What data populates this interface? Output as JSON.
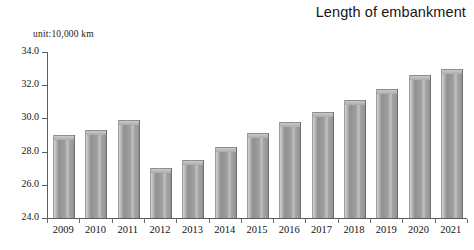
{
  "chart_data": {
    "type": "bar",
    "title": "Length of embankment",
    "unit_label": "unit:10,000 km",
    "xlabel": "",
    "ylabel": "",
    "ylim": [
      24.0,
      34.0
    ],
    "ytick_step": 2.0,
    "ytick_labels": [
      "34.0",
      "32.0",
      "30.0",
      "28.0",
      "26.0",
      "24.0"
    ],
    "ytick_values": [
      34.0,
      32.0,
      30.0,
      28.0,
      26.0,
      24.0
    ],
    "grid": false,
    "legend": null,
    "bar_color": "#9c9c9c",
    "categories": [
      "2009",
      "2010",
      "2011",
      "2012",
      "2013",
      "2014",
      "2015",
      "2016",
      "2017",
      "2018",
      "2019",
      "2020",
      "2021"
    ],
    "values": [
      29.0,
      29.3,
      29.9,
      27.0,
      27.5,
      28.3,
      29.1,
      29.8,
      30.4,
      31.1,
      31.8,
      32.6,
      33.0
    ]
  }
}
